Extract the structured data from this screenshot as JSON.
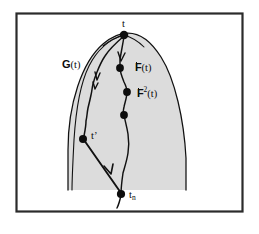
{
  "figure": {
    "frame": {
      "border_color": "#2b2b2b",
      "background_color": "#ffffff"
    },
    "region": {
      "name": "G(t)",
      "fill_color": "#dcdcdc",
      "stroke_color": "#111111"
    },
    "labels": {
      "region_label_letter": "G",
      "region_label_arg": "(t)",
      "apex_point": "t",
      "first_iterate_letter": "F",
      "first_iterate_arg": "(t)",
      "second_iterate_letter": "F",
      "second_iterate_exponent": "2",
      "second_iterate_arg": "(t)",
      "interior_point": "t",
      "interior_point_prime": "’",
      "terminal_point_base": "t",
      "terminal_point_sub": "n"
    },
    "points": [
      {
        "id": "apex",
        "label": "t",
        "x": 124,
        "y": 35
      },
      {
        "id": "iterate-1",
        "label": "F(t)",
        "x": 120,
        "y": 68
      },
      {
        "id": "iterate-2",
        "label": "F2(t)",
        "x": 127,
        "y": 92
      },
      {
        "id": "iterate-3",
        "label": "",
        "x": 124,
        "y": 115
      },
      {
        "id": "t-prime",
        "label": "t'",
        "x": 83,
        "y": 139
      },
      {
        "id": "t-n",
        "label": "tn",
        "x": 121,
        "y": 194
      }
    ],
    "caption_text": ""
  }
}
